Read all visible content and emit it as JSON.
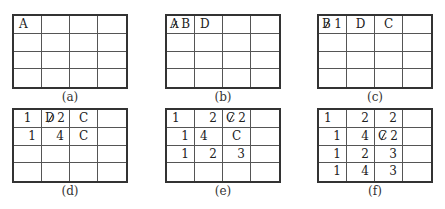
{
  "figure": {
    "panels": [
      {
        "label": "(a)",
        "rows": [
          [
            {
              "text": "A",
              "align": "left"
            },
            {
              "text": ""
            },
            {
              "text": ""
            },
            {
              "text": ""
            }
          ],
          [
            {
              "text": ""
            },
            {
              "text": ""
            },
            {
              "text": ""
            },
            {
              "text": ""
            }
          ],
          [
            {
              "text": ""
            },
            {
              "text": ""
            },
            {
              "text": ""
            },
            {
              "text": ""
            }
          ],
          [
            {
              "text": ""
            },
            {
              "text": ""
            },
            {
              "text": ""
            },
            {
              "text": ""
            }
          ]
        ]
      },
      {
        "label": "(b)",
        "rows": [
          [
            {
              "struck": "A",
              "text": "B",
              "align": "pair"
            },
            {
              "text": "D",
              "align": "left"
            },
            {
              "text": ""
            },
            {
              "text": ""
            }
          ],
          [
            {
              "text": ""
            },
            {
              "text": ""
            },
            {
              "text": ""
            },
            {
              "text": ""
            }
          ],
          [
            {
              "text": ""
            },
            {
              "text": ""
            },
            {
              "text": ""
            },
            {
              "text": ""
            }
          ],
          [
            {
              "text": ""
            },
            {
              "text": ""
            },
            {
              "text": ""
            },
            {
              "text": ""
            }
          ]
        ]
      },
      {
        "label": "(c)",
        "rows": [
          [
            {
              "struck": "B",
              "text": "1",
              "align": "pair"
            },
            {
              "text": "D",
              "align": "center"
            },
            {
              "text": "C",
              "align": "center"
            },
            {
              "text": ""
            }
          ],
          [
            {
              "text": ""
            },
            {
              "text": ""
            },
            {
              "text": ""
            },
            {
              "text": ""
            }
          ],
          [
            {
              "text": ""
            },
            {
              "text": ""
            },
            {
              "text": ""
            },
            {
              "text": ""
            }
          ],
          [
            {
              "text": ""
            },
            {
              "text": ""
            },
            {
              "text": ""
            },
            {
              "text": ""
            }
          ]
        ]
      },
      {
        "label": "(d)",
        "rows": [
          [
            {
              "text": "1",
              "align": "center"
            },
            {
              "struck": "D",
              "text": "2",
              "align": "pair"
            },
            {
              "text": "C",
              "align": "center"
            },
            {
              "text": ""
            }
          ],
          [
            {
              "text": "1",
              "align": "right"
            },
            {
              "text": "4",
              "align": "right"
            },
            {
              "text": "C",
              "align": "center"
            },
            {
              "text": ""
            }
          ],
          [
            {
              "text": ""
            },
            {
              "text": ""
            },
            {
              "text": ""
            },
            {
              "text": ""
            }
          ],
          [
            {
              "text": ""
            },
            {
              "text": ""
            },
            {
              "text": ""
            },
            {
              "text": ""
            }
          ]
        ]
      },
      {
        "label": "(e)",
        "rows": [
          [
            {
              "text": "1",
              "align": "left"
            },
            {
              "text": "2",
              "align": "right"
            },
            {
              "struck": "C",
              "text": "2",
              "align": "pair"
            },
            {
              "text": ""
            }
          ],
          [
            {
              "text": "1",
              "align": "right"
            },
            {
              "text": "4",
              "align": "left"
            },
            {
              "text": "C",
              "align": "center"
            },
            {
              "text": ""
            }
          ],
          [
            {
              "text": "1",
              "align": "right"
            },
            {
              "text": "2",
              "align": "right"
            },
            {
              "text": "3",
              "align": "right"
            },
            {
              "text": ""
            }
          ],
          [
            {
              "text": ""
            },
            {
              "text": ""
            },
            {
              "text": ""
            },
            {
              "text": ""
            }
          ]
        ]
      },
      {
        "label": "(f)",
        "rows": [
          [
            {
              "text": "1",
              "align": "left"
            },
            {
              "text": "2",
              "align": "right"
            },
            {
              "text": "2",
              "align": "right"
            },
            {
              "text": ""
            }
          ],
          [
            {
              "text": "1",
              "align": "right"
            },
            {
              "text": "4",
              "align": "right"
            },
            {
              "struck": "C",
              "text": "2",
              "align": "pair"
            },
            {
              "text": ""
            }
          ],
          [
            {
              "text": "1",
              "align": "right"
            },
            {
              "text": "2",
              "align": "right"
            },
            {
              "text": "3",
              "align": "right"
            },
            {
              "text": ""
            }
          ],
          [
            {
              "text": "1",
              "align": "right"
            },
            {
              "text": "4",
              "align": "right"
            },
            {
              "text": "3",
              "align": "right"
            },
            {
              "text": ""
            }
          ]
        ]
      }
    ]
  }
}
